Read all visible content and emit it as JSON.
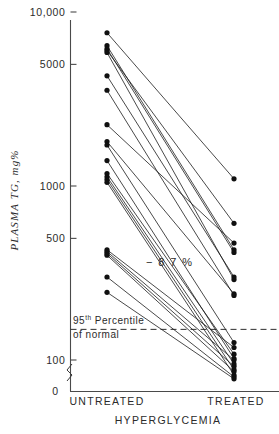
{
  "figure": {
    "y_axis_title": "PLASMA  TG, mg%",
    "x_axis_title": "HYPERGLYCEMIA",
    "left_category": "UNTREATED",
    "right_category": "TREATED",
    "change_annotation": "− 8 7 %",
    "reference_line_label_1": "95",
    "reference_line_label_sup": "th",
    "reference_line_label_2": "Percentile",
    "reference_line_label_3": "of  normal",
    "zero_label": "0",
    "tick_labels": [
      "10,000",
      "5000",
      "1000",
      "500",
      "100"
    ],
    "marker_color": "#101010",
    "line_color": "#1c1c1c",
    "axis_color": "#4a4a4a"
  },
  "chart_data": {
    "type": "line",
    "title": "",
    "subtitle": "",
    "xlabel": "HYPERGLYCEMIA",
    "ylabel": "PLASMA TG, mg%",
    "yscale": "log",
    "ylim": [
      90,
      11000
    ],
    "yticks": [
      100,
      500,
      1000,
      5000,
      10000
    ],
    "ytick_labels": [
      "100",
      "500",
      "1000",
      "5000",
      "10,000"
    ],
    "axis_break_below": 100,
    "grid": false,
    "legend": null,
    "categories": [
      "UNTREATED",
      "TREATED"
    ],
    "annotations": [
      {
        "text": "- 87%",
        "x": 0.47,
        "y": 430,
        "note": "mean percent change in plasma triglyceride"
      },
      {
        "text": "95th Percentile of normal",
        "y": 150,
        "note": "dashed horizontal reference line"
      }
    ],
    "reference_lines": [
      {
        "y": 150,
        "style": "dashed",
        "label": "95th Percentile of normal"
      }
    ],
    "series": [
      {
        "name": "patient-1",
        "values": [
          7600,
          1100
        ]
      },
      {
        "name": "patient-2",
        "values": [
          6400,
          430
        ]
      },
      {
        "name": "patient-3",
        "values": [
          6150,
          415
        ]
      },
      {
        "name": "patient-4",
        "values": [
          6000,
          610
        ]
      },
      {
        "name": "patient-5",
        "values": [
          5850,
          290
        ]
      },
      {
        "name": "patient-6",
        "values": [
          4300,
          300
        ]
      },
      {
        "name": "patient-7",
        "values": [
          3550,
          235
        ]
      },
      {
        "name": "patient-8",
        "values": [
          2250,
          470
        ]
      },
      {
        "name": "patient-9",
        "values": [
          1800,
          240
        ]
      },
      {
        "name": "patient-10",
        "values": [
          1720,
          126
        ]
      },
      {
        "name": "patient-11",
        "values": [
          1400,
          102
        ]
      },
      {
        "name": "patient-12",
        "values": [
          1180,
          108
        ]
      },
      {
        "name": "patient-13",
        "values": [
          1130,
          95
        ]
      },
      {
        "name": "patient-14",
        "values": [
          1090,
          88
        ]
      },
      {
        "name": "patient-15",
        "values": [
          1050,
          82
        ]
      },
      {
        "name": "patient-16",
        "values": [
          430,
          118
        ]
      },
      {
        "name": "patient-17",
        "values": [
          420,
          100
        ]
      },
      {
        "name": "patient-18",
        "values": [
          410,
          92
        ]
      },
      {
        "name": "patient-19",
        "values": [
          400,
          86
        ]
      },
      {
        "name": "patient-20",
        "values": [
          300,
          80
        ]
      },
      {
        "name": "patient-21",
        "values": [
          245,
          78
        ]
      }
    ]
  }
}
